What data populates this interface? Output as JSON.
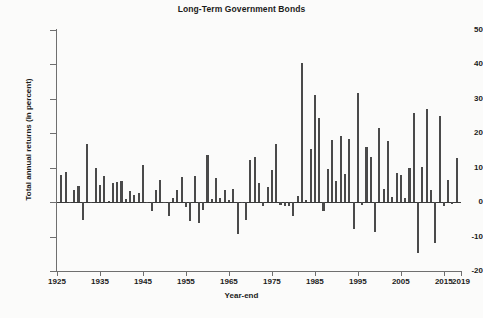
{
  "chart_data": {
    "type": "bar",
    "title": "Long-Term Government Bonds",
    "xlabel": "Year-end",
    "ylabel": "Total annual returns (in percent)",
    "ylim": [
      -20,
      50
    ],
    "xlim": [
      1925,
      2019
    ],
    "grid": false,
    "legend": null,
    "bar_color": "#4a4a4a",
    "axis_color": "#6f6f6f",
    "ytick_values": [
      -20,
      -10,
      0,
      10,
      20,
      30,
      40,
      50
    ],
    "ytick_labels": [
      "-20",
      "-10",
      "0",
      "10",
      "20",
      "30",
      "40",
      "50"
    ],
    "xtick_values": [
      1925,
      1935,
      1945,
      1955,
      1965,
      1975,
      1985,
      1995,
      2005,
      2015,
      2019
    ],
    "xtick_labels": [
      "1925",
      "1935",
      "1945",
      "1955",
      "1965",
      "1975",
      "1985",
      "1995",
      "2005",
      "2015",
      "2019"
    ],
    "categories": [
      1926,
      1927,
      1928,
      1929,
      1930,
      1931,
      1932,
      1933,
      1934,
      1935,
      1936,
      1937,
      1938,
      1939,
      1940,
      1941,
      1942,
      1943,
      1944,
      1945,
      1946,
      1947,
      1948,
      1949,
      1950,
      1951,
      1952,
      1953,
      1954,
      1955,
      1956,
      1957,
      1958,
      1959,
      1960,
      1961,
      1962,
      1963,
      1964,
      1965,
      1966,
      1967,
      1968,
      1969,
      1970,
      1971,
      1972,
      1973,
      1974,
      1975,
      1976,
      1977,
      1978,
      1979,
      1980,
      1981,
      1982,
      1983,
      1984,
      1985,
      1986,
      1987,
      1988,
      1989,
      1990,
      1991,
      1992,
      1993,
      1994,
      1995,
      1996,
      1997,
      1998,
      1999,
      2000,
      2001,
      2002,
      2003,
      2004,
      2005,
      2006,
      2007,
      2008,
      2009,
      2010,
      2011,
      2012,
      2013,
      2014,
      2015,
      2016,
      2017,
      2018
    ],
    "values": [
      7.8,
      8.9,
      0.1,
      3.4,
      4.7,
      -5.3,
      16.8,
      -0.1,
      10.0,
      5.1,
      7.5,
      0.2,
      5.5,
      5.9,
      6.1,
      0.9,
      3.2,
      2.1,
      2.8,
      10.7,
      -0.1,
      -2.6,
      3.4,
      6.5,
      0.1,
      -3.9,
      1.2,
      3.6,
      7.2,
      -1.3,
      -5.6,
      7.5,
      -6.1,
      -2.3,
      13.8,
      0.9,
      6.9,
      1.2,
      3.5,
      0.7,
      3.7,
      -9.2,
      -0.3,
      -5.1,
      12.1,
      13.2,
      5.7,
      -1.1,
      4.4,
      9.2,
      16.8,
      -0.7,
      -1.2,
      -1.2,
      -3.9,
      1.9,
      40.4,
      0.7,
      15.5,
      31.0,
      24.5,
      -2.7,
      9.7,
      18.1,
      6.2,
      19.3,
      8.1,
      18.2,
      -7.8,
      31.7,
      -0.9,
      15.9,
      13.1,
      -8.7,
      21.5,
      3.7,
      17.8,
      1.5,
      8.5,
      7.8,
      1.2,
      9.9,
      25.9,
      -14.9,
      10.1,
      27.1,
      3.4,
      -12.0,
      25.0,
      -1.2,
      6.5,
      -0.4,
      12.7
    ]
  }
}
